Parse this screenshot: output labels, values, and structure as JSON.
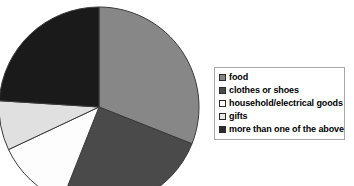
{
  "chart_data": {
    "type": "pie",
    "title": "",
    "legend_position": "right",
    "categories": [
      "food",
      "clothes or shoes",
      "household/electrical goods",
      "gifts",
      "more than one of the above"
    ],
    "values": [
      31,
      25,
      12,
      8,
      24
    ],
    "unit": "percent",
    "start_angle_deg": 0,
    "direction": "clockwise",
    "colors": [
      "#878787",
      "#4a4a4a",
      "#fdfdfd",
      "#e0e0e0",
      "#1a1a1a"
    ],
    "slice_border_color": "#3a3a3a",
    "labels_shown": false,
    "data_labels": []
  },
  "pie": {
    "center_x": 99,
    "center_y": 107,
    "radius": 100,
    "slices": [
      {
        "name": "food",
        "value": 31,
        "color": "#878787",
        "start": 0,
        "end": 111.6
      },
      {
        "name": "clothes or shoes",
        "value": 25,
        "color": "#4a4a4a",
        "start": 111.6,
        "end": 201.6
      },
      {
        "name": "household/electrical goods",
        "value": 12,
        "color": "#fdfdfd",
        "start": 201.6,
        "end": 244.8
      },
      {
        "name": "gifts",
        "value": 8,
        "color": "#e0e0e0",
        "start": 244.8,
        "end": 273.6
      },
      {
        "name": "more than one of the above",
        "value": 24,
        "color": "#1a1a1a",
        "start": 273.6,
        "end": 360
      }
    ]
  },
  "legend": {
    "items": [
      {
        "label": "food",
        "color": "#878787"
      },
      {
        "label": "clothes or shoes",
        "color": "#4a4a4a"
      },
      {
        "label": "household/electrical goods",
        "color": "#ffffff"
      },
      {
        "label": "gifts",
        "color": "#e8e8e8"
      },
      {
        "label": "more than one of the above",
        "color": "#2b2b2b"
      }
    ]
  }
}
